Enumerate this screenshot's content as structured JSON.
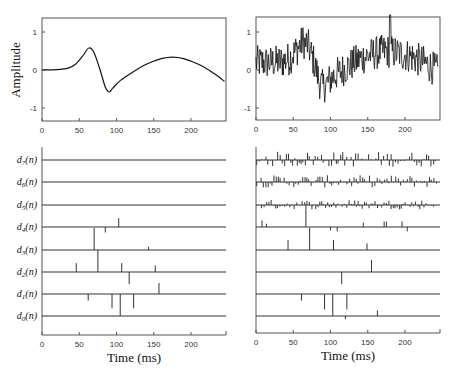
{
  "chart_data": [
    {
      "id": "top-left",
      "type": "line",
      "title": "",
      "xlabel": "",
      "ylabel": "Amplitude",
      "xlim": [
        0,
        245
      ],
      "ylim": [
        -1.3,
        1.3
      ],
      "xticks": [
        0,
        50,
        100,
        150,
        200
      ],
      "yticks": [
        1,
        0,
        -1
      ],
      "description": "Clean signal: flat near 0, positive peak ~0.6 at ~63 ms, negative trough ~-0.6 at ~90 ms, broad positive hump ~0.35 at ~175 ms, decreasing to ~-0.3 at 245 ms",
      "x": [
        0,
        20,
        35,
        45,
        55,
        63,
        70,
        78,
        85,
        90,
        95,
        105,
        120,
        140,
        160,
        175,
        190,
        210,
        230,
        245
      ],
      "y": [
        0.0,
        0.01,
        0.05,
        0.15,
        0.38,
        0.58,
        0.45,
        0.0,
        -0.45,
        -0.58,
        -0.48,
        -0.28,
        -0.08,
        0.15,
        0.3,
        0.34,
        0.3,
        0.15,
        -0.08,
        -0.3
      ]
    },
    {
      "id": "top-right",
      "type": "line",
      "title": "",
      "xlabel": "",
      "ylabel": "",
      "xlim": [
        0,
        245
      ],
      "ylim": [
        -1.3,
        1.3
      ],
      "xticks": [
        0,
        50,
        100,
        150,
        200
      ],
      "yticks": [
        1,
        0,
        -1
      ],
      "description": "Noisy version of the same signal: the clean waveform plus high-frequency noise (approx ±0.5); envelope rises to ~1.1 around 55-70 ms, dips to ~-0.9 around 85-100 ms, ~0.5-1.0 from 140-210 ms, spike to ~1.3 near 180 ms",
      "noise_amplitude": 0.45,
      "x": [
        0,
        20,
        35,
        45,
        55,
        63,
        70,
        78,
        85,
        90,
        95,
        105,
        120,
        140,
        160,
        175,
        190,
        210,
        230,
        245
      ],
      "y_clean": [
        0.2,
        0.2,
        0.22,
        0.3,
        0.55,
        0.75,
        0.65,
        0.2,
        -0.3,
        -0.45,
        -0.35,
        -0.15,
        0.05,
        0.3,
        0.45,
        0.5,
        0.45,
        0.35,
        0.15,
        -0.05
      ]
    },
    {
      "id": "bottom-left",
      "type": "stem",
      "xlabel": "Time (ms)",
      "xlim": [
        0,
        245
      ],
      "xticks": [
        0,
        50,
        100,
        150,
        200
      ],
      "rows": [
        {
          "label": "d7(n)",
          "sub": "7",
          "spikes": []
        },
        {
          "label": "d6(n)",
          "sub": "6",
          "spikes": []
        },
        {
          "label": "d5(n)",
          "sub": "5",
          "spikes": []
        },
        {
          "label": "d4(n)",
          "sub": "4",
          "spikes": [
            {
              "t": 103,
              "h": 0.4
            },
            {
              "t": 85,
              "h": -0.25
            }
          ]
        },
        {
          "label": "d3(n)",
          "sub": "3",
          "spikes": [
            {
              "t": 70,
              "h": 1.0
            },
            {
              "t": 143,
              "h": 0.15
            }
          ]
        },
        {
          "label": "d2(n)",
          "sub": "2",
          "spikes": [
            {
              "t": 46,
              "h": 0.4
            },
            {
              "t": 75,
              "h": 1.0
            },
            {
              "t": 107,
              "h": 0.4
            },
            {
              "t": 152,
              "h": 0.3
            },
            {
              "t": 117,
              "h": -0.55
            }
          ]
        },
        {
          "label": "d1(n)",
          "sub": "1",
          "spikes": [
            {
              "t": 157,
              "h": 0.5
            },
            {
              "t": 62,
              "h": -0.3
            },
            {
              "t": 94,
              "h": -0.65
            },
            {
              "t": 105,
              "h": -1.0
            },
            {
              "t": 123,
              "h": -0.65
            }
          ]
        },
        {
          "label": "d0(n)",
          "sub": "0",
          "spikes": []
        }
      ]
    },
    {
      "id": "bottom-right",
      "type": "stem",
      "xlabel": "Time (ms)",
      "xlim": [
        0,
        245
      ],
      "xticks": [
        0,
        50,
        100,
        150,
        200
      ],
      "description": "Wavelet coefficients of the noisy signal: rows d7,d6,d5 contain many small noise coefficients; d4..d0 contain the same large coefficients as left plus some small extras",
      "rows": [
        {
          "label": "d7(n)",
          "dense_noise": 0.35,
          "spikes": []
        },
        {
          "label": "d6(n)",
          "dense_noise": 0.28,
          "spikes": []
        },
        {
          "label": "d5(n)",
          "dense_noise": 0.22,
          "spikes": []
        },
        {
          "label": "d4(n)",
          "spikes": [
            {
              "t": 8,
              "h": 0.3
            },
            {
              "t": 14,
              "h": 0.15
            },
            {
              "t": 67,
              "h": 1.0
            },
            {
              "t": 100,
              "h": -0.15
            },
            {
              "t": 109,
              "h": -0.2
            },
            {
              "t": 144,
              "h": 0.2
            },
            {
              "t": 172,
              "h": 0.25
            },
            {
              "t": 175,
              "h": 0.25
            },
            {
              "t": 196,
              "h": 0.25
            },
            {
              "t": 203,
              "h": -0.2
            }
          ]
        },
        {
          "label": "d3(n)",
          "spikes": [
            {
              "t": 43,
              "h": 0.45
            },
            {
              "t": 72,
              "h": 1.0
            },
            {
              "t": 104,
              "h": 0.45
            },
            {
              "t": 149,
              "h": 0.3
            }
          ]
        },
        {
          "label": "d2(n)",
          "spikes": [
            {
              "t": 115,
              "h": -0.55
            },
            {
              "t": 155,
              "h": 0.55
            }
          ]
        },
        {
          "label": "d1(n)",
          "spikes": [
            {
              "t": 61,
              "h": -0.3
            },
            {
              "t": 92,
              "h": -0.7
            },
            {
              "t": 103,
              "h": -1.0
            },
            {
              "t": 122,
              "h": -0.7
            }
          ]
        },
        {
          "label": "d0(n)",
          "spikes": [
            {
              "t": 120,
              "h": -0.15
            },
            {
              "t": 163,
              "h": 0.25
            }
          ]
        }
      ]
    }
  ],
  "labels": {
    "ylabel": "Amplitude",
    "xlabel_left": "Time (ms)",
    "xlabel_right": "Time (ms)",
    "row_prefix": "d",
    "row_suffix": "(n)"
  }
}
